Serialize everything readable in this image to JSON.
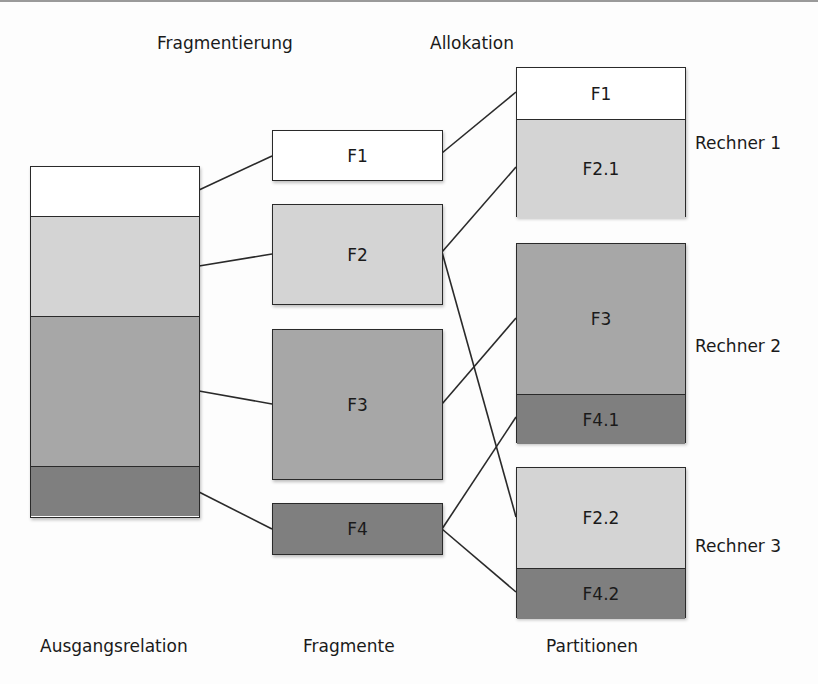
{
  "headings": {
    "fragmentierung": "Fragmentierung",
    "allokation": "Allokation"
  },
  "footers": {
    "ausgangsrelation": "Ausgangsrelation",
    "fragmente": "Fragmente",
    "partitionen": "Partitionen"
  },
  "colors": {
    "white": "#ffffff",
    "light": "#d4d4d4",
    "medium": "#a7a7a7",
    "dark": "#7f7f7f",
    "stroke": "#2a2a2a"
  },
  "relation": {
    "segments": [
      {
        "shade": "white"
      },
      {
        "shade": "light"
      },
      {
        "shade": "medium"
      },
      {
        "shade": "dark"
      }
    ]
  },
  "fragments": [
    {
      "label": "F1",
      "shade": "white"
    },
    {
      "label": "F2",
      "shade": "light"
    },
    {
      "label": "F3",
      "shade": "medium"
    },
    {
      "label": "F4",
      "shade": "dark"
    }
  ],
  "partitions": [
    {
      "node": "Rechner 1",
      "parts": [
        {
          "label": "F1",
          "shade": "white"
        },
        {
          "label": "F2.1",
          "shade": "light"
        }
      ]
    },
    {
      "node": "Rechner 2",
      "parts": [
        {
          "label": "F3",
          "shade": "medium"
        },
        {
          "label": "F4.1",
          "shade": "dark"
        }
      ]
    },
    {
      "node": "Rechner 3",
      "parts": [
        {
          "label": "F2.2",
          "shade": "light"
        },
        {
          "label": "F4.2",
          "shade": "dark"
        }
      ]
    }
  ]
}
